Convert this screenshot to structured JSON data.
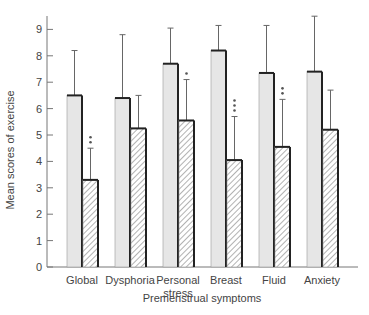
{
  "chart_data": {
    "type": "bar",
    "title": "",
    "xlabel": "Premenstrual symptoms",
    "ylabel": "Mean scores of exercise",
    "ylim": [
      0,
      9.5
    ],
    "yticks": [
      0,
      1,
      2,
      3,
      4,
      5,
      6,
      7,
      8,
      9
    ],
    "grid": false,
    "legend": null,
    "categories": [
      "Global",
      "Dysphoria",
      "Personal stress",
      "Breast",
      "Fluid",
      "Anxiety"
    ],
    "category_labels": [
      [
        "Global"
      ],
      [
        "Dysphoria"
      ],
      [
        "Personal",
        "stress"
      ],
      [
        "Breast"
      ],
      [
        "Fluid"
      ],
      [
        "Anxiety"
      ]
    ],
    "series": [
      {
        "name": "Group 1 (plain)",
        "fill": "#e6e6e6",
        "pattern": "solid",
        "values": [
          6.5,
          6.4,
          7.7,
          8.2,
          7.35,
          7.4
        ],
        "error_upper": [
          8.2,
          8.8,
          9.05,
          9.15,
          9.15,
          9.5
        ]
      },
      {
        "name": "Group 2 (hatched)",
        "fill": "#ffffff",
        "pattern": "diagonal-hatch",
        "values": [
          3.3,
          5.25,
          5.55,
          4.05,
          4.55,
          5.2
        ],
        "error_upper": [
          4.5,
          6.5,
          7.1,
          5.7,
          6.35,
          6.7
        ],
        "significance": [
          "**",
          "",
          "*",
          "***",
          "**",
          ""
        ]
      }
    ]
  },
  "colors": {
    "axis": "#777777",
    "bar_outline": "#222222",
    "plain_fill": "#e6e6e6",
    "text": "#444444"
  }
}
